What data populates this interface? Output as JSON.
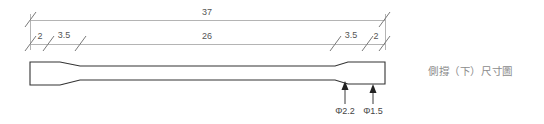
{
  "drawing": {
    "caption": "側撐（下）尺寸圖",
    "overall_dimension": {
      "label": "37",
      "x_start": 30,
      "x_end": 385,
      "line_y": 20,
      "text_x": 207,
      "text_y": 15
    },
    "segment_dimensions": {
      "line_y": 44,
      "text_y": 39,
      "segments": [
        {
          "label": "2",
          "x_start": 30,
          "x_end": 48,
          "text_x": 39
        },
        {
          "label": "3.5",
          "x_start": 48,
          "x_end": 80,
          "text_x": 64
        },
        {
          "label": "26",
          "x_start": 80,
          "x_end": 335,
          "text_x": 207
        },
        {
          "label": "3.5",
          "x_start": 335,
          "x_end": 367,
          "text_x": 351
        },
        {
          "label": "2",
          "x_start": 367,
          "x_end": 385,
          "text_x": 376
        }
      ]
    },
    "profile": {
      "description": "side brace tapered flat bar profile",
      "outline_points": "30,62 30,85 60,85 80,80 335,80 348,84 385,84 385,62 348,62 335,66 80,66 60,62 30,62"
    },
    "callouts": [
      {
        "label": "Φ2.2",
        "arrow_x": 345,
        "arrow_tip_y": 81,
        "leader_bottom_y": 104,
        "text_x": 345,
        "text_y": 114
      },
      {
        "label": "Φ1.5",
        "arrow_x": 373,
        "arrow_tip_y": 84,
        "leader_bottom_y": 104,
        "text_x": 373,
        "text_y": 114
      }
    ],
    "colors": {
      "dimension_line": "#b4b4b4",
      "dimension_tick": "#7a7a7a",
      "profile_stroke": "#333333",
      "dimension_text": "#555555",
      "callout_text": "#444444",
      "caption_text": "#8c8c8c",
      "background": "#ffffff"
    }
  }
}
